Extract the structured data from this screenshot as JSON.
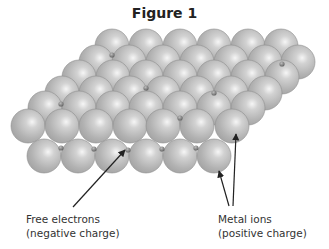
{
  "figure": {
    "title": "Figure 1",
    "colors": {
      "ion_fill": "#b4b4b4",
      "ion_highlight": "#f4f4f4",
      "ion_edge": "#8e8e8e",
      "electron": "#7a7a7a",
      "arrow": "#222222"
    },
    "sphere_radius": 17,
    "ion_rows": [
      {
        "y": 46,
        "x": [
          112,
          146,
          180,
          214,
          248,
          281
        ]
      },
      {
        "y": 62,
        "x": [
          96,
          129,
          163,
          197,
          231,
          265,
          298
        ]
      },
      {
        "y": 77,
        "x": [
          79,
          113,
          146,
          180,
          214,
          248,
          282
        ]
      },
      {
        "y": 93,
        "x": [
          62,
          96,
          130,
          163,
          197,
          231,
          265
        ]
      },
      {
        "y": 108,
        "x": [
          45,
          79,
          113,
          146,
          180,
          214,
          248
        ]
      },
      {
        "y": 126,
        "x": [
          28,
          62,
          96,
          130,
          163,
          197,
          232
        ]
      },
      {
        "y": 156,
        "x": [
          44,
          78,
          112,
          146,
          180,
          214
        ]
      }
    ],
    "electrons": [
      {
        "x": 112,
        "y": 55
      },
      {
        "x": 282,
        "y": 64
      },
      {
        "x": 146,
        "y": 88
      },
      {
        "x": 214,
        "y": 93
      },
      {
        "x": 61,
        "y": 104
      },
      {
        "x": 180,
        "y": 118
      },
      {
        "x": 61,
        "y": 148
      },
      {
        "x": 94,
        "y": 149
      },
      {
        "x": 128,
        "y": 150
      },
      {
        "x": 162,
        "y": 149
      },
      {
        "x": 196,
        "y": 148
      }
    ],
    "labels": {
      "free_electrons": {
        "line1": "Free electrons",
        "line2": "(negative charge)"
      },
      "metal_ions": {
        "line1": "Metal ions",
        "line2": "(positive charge)"
      }
    },
    "arrows": [
      {
        "from": [
          73,
          207
        ],
        "to": [
          125,
          150
        ],
        "target": "free-electron"
      },
      {
        "from": [
          229,
          206
        ],
        "to": [
          219,
          171
        ],
        "target": "metal-ion"
      },
      {
        "from": [
          233,
          206
        ],
        "to": [
          236,
          134
        ],
        "target": "metal-ion"
      }
    ]
  }
}
